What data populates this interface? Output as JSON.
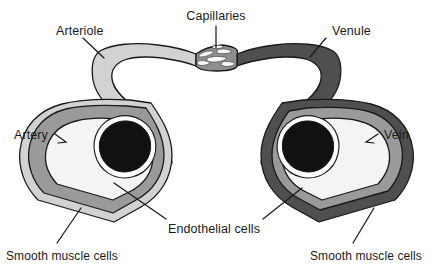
{
  "figure": {
    "background_color": "#ffffff",
    "width": 433,
    "height": 268
  },
  "colors": {
    "outline": "#1a1a1a",
    "arterial_outer_wall": "#d2d2d2",
    "arterial_smooth_muscle": "#9a9a9a",
    "venous_outer_wall": "#4f4f4f",
    "venous_smooth_muscle": "#9a9a9a",
    "lumen": "#f4f4f4",
    "blood_cell_mass": "#111111",
    "capillary_tissue": "#8e8e8e",
    "capillary_channel": "#fafafa",
    "label_text": "#1a1a1a"
  },
  "labels": {
    "capillaries": "Capillaries",
    "arteriole": "Arteriole",
    "venule": "Venule",
    "artery": "Artery",
    "vein": "Vein",
    "endothelial_cells": "Endothelial cells",
    "smooth_muscle_cells_left": "Smooth muscle cells",
    "smooth_muscle_cells_right": "Smooth muscle cells"
  },
  "structures": [
    {
      "name": "arteriole",
      "side": "left",
      "wall_color": "#d2d2d2",
      "description": "Light gray arteriole arching from upper-left down to the artery cross-section"
    },
    {
      "name": "venule",
      "side": "right",
      "wall_color": "#4f4f4f",
      "description": "Dark gray venule arching from upper-right down to the vein cross-section"
    },
    {
      "name": "capillary-bed",
      "side": "center",
      "wall_color": "#8e8e8e",
      "description": "Mesh of white capillary channels between arteriole and venule"
    },
    {
      "name": "artery",
      "side": "left",
      "wall_color": "#d2d2d2",
      "muscle_color": "#9a9a9a",
      "lumen_color": "#f4f4f4",
      "description": "Artery cross-section with thick smooth muscle layer and black blood cell mass"
    },
    {
      "name": "vein",
      "side": "right",
      "wall_color": "#4f4f4f",
      "muscle_color": "#9a9a9a",
      "lumen_color": "#f4f4f4",
      "description": "Vein cross-section with thinner wall and black blood cell mass"
    }
  ]
}
